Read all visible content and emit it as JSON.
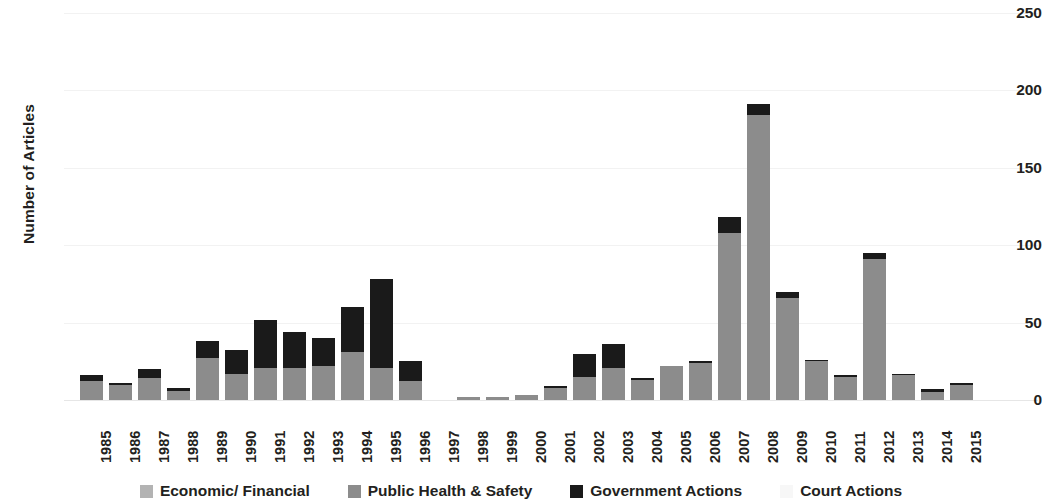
{
  "chart_data": {
    "type": "bar",
    "subtype": "stacked-bar",
    "title": "",
    "xlabel": "",
    "ylabel": "Number of Articles",
    "ylim": [
      0,
      250
    ],
    "yticks": [
      0,
      50,
      100,
      150,
      200,
      250
    ],
    "grid": true,
    "legend_position": "bottom",
    "categories": [
      "1985",
      "1986",
      "1987",
      "1988",
      "1989",
      "1990",
      "1991",
      "1992",
      "1993",
      "1994",
      "1995",
      "1996",
      "1997",
      "1998",
      "1999",
      "2000",
      "2001",
      "2002",
      "2003",
      "2004",
      "2005",
      "2006",
      "2007",
      "2008",
      "2009",
      "2010",
      "2011",
      "2012",
      "2013",
      "2014",
      "2015"
    ],
    "series": [
      {
        "name": "Economic/ Financial",
        "color": "#b3b3b3",
        "values": [
          0,
          0,
          0,
          0,
          0,
          0,
          0,
          0,
          0,
          0,
          0,
          0,
          0,
          0,
          0,
          0,
          0,
          0,
          0,
          0,
          0,
          0,
          0,
          0,
          0,
          0,
          0,
          0,
          0,
          0,
          0
        ]
      },
      {
        "name": "Public Health & Safety",
        "color": "#8c8c8c",
        "values": [
          12,
          10,
          14,
          6,
          27,
          17,
          21,
          21,
          22,
          31,
          21,
          12,
          0,
          2,
          2,
          3,
          8,
          15,
          21,
          13,
          22,
          24,
          108,
          184,
          66,
          25,
          15,
          91,
          16,
          5,
          10
        ]
      },
      {
        "name": "Government Actions",
        "color": "#1a1a1a",
        "values": [
          4,
          1,
          6,
          2,
          11,
          15,
          31,
          23,
          18,
          29,
          57,
          13,
          0,
          0,
          0,
          0,
          1,
          15,
          15,
          1,
          0,
          1,
          10,
          7,
          4,
          1,
          1,
          4,
          1,
          2,
          1
        ]
      },
      {
        "name": "Court Actions",
        "color": "#f7f7f7",
        "values": [
          0,
          0,
          0,
          0,
          0,
          0,
          0,
          0,
          0,
          0,
          0,
          0,
          0,
          0,
          0,
          0,
          0,
          0,
          0,
          0,
          0,
          0,
          0,
          0,
          0,
          0,
          0,
          0,
          0,
          0,
          0
        ]
      }
    ],
    "totals": [
      16,
      11,
      20,
      8,
      38,
      32,
      52,
      44,
      40,
      60,
      78,
      25,
      0,
      2,
      2,
      3,
      9,
      30,
      36,
      14,
      22,
      25,
      118,
      191,
      70,
      26,
      16,
      95,
      17,
      7,
      11
    ]
  },
  "legend": {
    "items": [
      {
        "label": "Economic/ Financial",
        "color": "#b3b3b3"
      },
      {
        "label": "Public Health & Safety",
        "color": "#8c8c8c"
      },
      {
        "label": "Government Actions",
        "color": "#1a1a1a"
      },
      {
        "label": "Court Actions",
        "color": "#f7f7f7"
      }
    ]
  }
}
